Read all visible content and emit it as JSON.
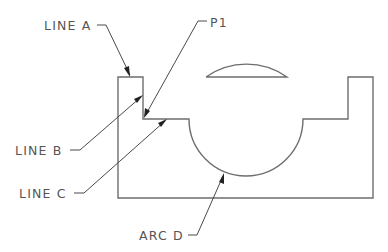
{
  "drawing": {
    "labels": {
      "line_a": "LINE A",
      "p1": "P1",
      "line_b": "LINE B",
      "line_c": "LINE C",
      "arc_d": "ARC D"
    },
    "colors": {
      "geometry": "#6e6e6e",
      "leader": "#4a4a4a",
      "text": "#555555",
      "background": "#ffffff"
    }
  }
}
